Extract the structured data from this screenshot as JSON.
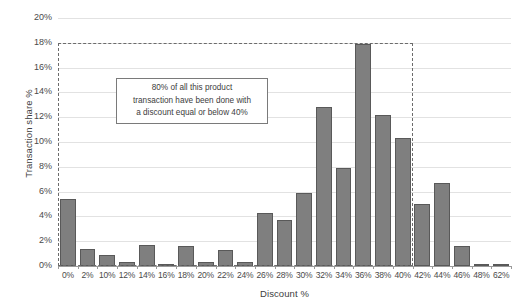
{
  "chart": {
    "title": "",
    "y_axis_title": "Transaction share %",
    "x_axis_title": "Discount %",
    "annotation": "80% of all this product\ntransaction have been done with\na discount equal or below 40%",
    "bar_color": "#7f7f7f",
    "bar_border_color": "#595959",
    "gridline_color": "#e2e2e2",
    "highlight_border_color": "#6b6b6b"
  },
  "chart_data": {
    "type": "bar",
    "title": "",
    "xlabel": "Discount %",
    "ylabel": "Transaction share %",
    "ylim": [
      0,
      20
    ],
    "ytick_labels": [
      "0%",
      "2%",
      "4%",
      "6%",
      "8%",
      "10%",
      "12%",
      "14%",
      "16%",
      "18%",
      "20%"
    ],
    "ytick_values": [
      0,
      2,
      4,
      6,
      8,
      10,
      12,
      14,
      16,
      18,
      20
    ],
    "grid": true,
    "legend": "none",
    "categories": [
      "0%",
      "2%",
      "10%",
      "12%",
      "14%",
      "16%",
      "18%",
      "20%",
      "22%",
      "24%",
      "26%",
      "28%",
      "30%",
      "32%",
      "34%",
      "36%",
      "38%",
      "40%",
      "42%",
      "44%",
      "46%",
      "48%",
      "62%"
    ],
    "values": [
      5.4,
      1.4,
      0.9,
      0.3,
      1.7,
      0.2,
      1.6,
      0.3,
      1.3,
      0.3,
      4.3,
      3.7,
      5.9,
      12.8,
      7.9,
      17.9,
      12.2,
      10.3,
      5.0,
      6.7,
      1.6,
      0.08,
      0.08
    ],
    "annotations": [
      {
        "text": "80% of all this product transaction have been done with a discount equal or below 40%",
        "type": "textbox"
      },
      {
        "type": "dashed-rectangle",
        "x_from": "0%",
        "x_to": "40%",
        "y_from": 0,
        "y_to": 18
      }
    ]
  }
}
